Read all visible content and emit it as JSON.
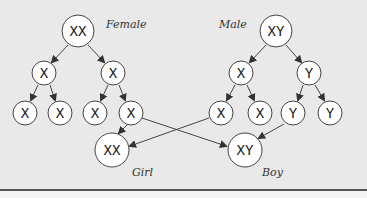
{
  "diagram": {
    "parents": {
      "female": {
        "label": "Female",
        "chromosomes": "XX"
      },
      "male": {
        "label": "Male",
        "chromosomes": "XY"
      }
    },
    "gametes_level1": {
      "female": [
        "X",
        "X"
      ],
      "male": [
        "X",
        "Y"
      ]
    },
    "gametes_level2": {
      "female": [
        "X",
        "X",
        "X",
        "X"
      ],
      "male": [
        "X",
        "X",
        "Y",
        "Y"
      ]
    },
    "offspring": {
      "girl": {
        "label": "Girl",
        "chromosomes": "XX"
      },
      "boy": {
        "label": "Boy",
        "chromosomes": "XY"
      }
    },
    "colors": {
      "background": "#e9e9e9",
      "circle_fill": "#ffffff",
      "stroke": "#333333",
      "rule": "#555555"
    }
  }
}
